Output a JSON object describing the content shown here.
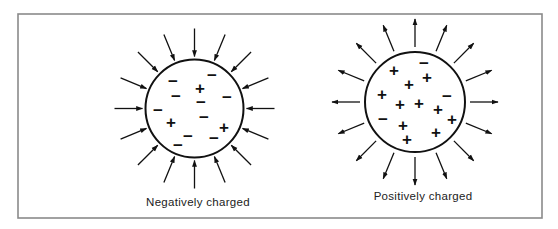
{
  "figure": {
    "frame": {
      "x": 18,
      "y": 14,
      "width": 524,
      "height": 204,
      "stroke": "#8a8a8a"
    },
    "ink_color": "#111111",
    "particles": [
      {
        "id": "negative",
        "label": "Negatively charged",
        "center": [
          194.5,
          108.5
        ],
        "radius": 49,
        "arrow_direction": "inward",
        "arrow_count": 16,
        "arrow_inner_radius": 52,
        "arrow_outer_radius": 80,
        "label_pos": [
          198,
          206
        ],
        "signs": [
          {
            "s": "−",
            "x": 173,
            "y": 81
          },
          {
            "s": "−",
            "x": 212,
            "y": 75
          },
          {
            "s": "+",
            "x": 200,
            "y": 88
          },
          {
            "s": "−",
            "x": 176,
            "y": 96
          },
          {
            "s": "−",
            "x": 227,
            "y": 97
          },
          {
            "s": "−",
            "x": 201,
            "y": 102
          },
          {
            "s": "−",
            "x": 158,
            "y": 110
          },
          {
            "s": "−",
            "x": 204,
            "y": 117
          },
          {
            "s": "+",
            "x": 171,
            "y": 122
          },
          {
            "s": "+",
            "x": 224,
            "y": 127
          },
          {
            "s": "−",
            "x": 188,
            "y": 136
          },
          {
            "s": "−",
            "x": 214,
            "y": 138
          },
          {
            "s": "−",
            "x": 178,
            "y": 145
          }
        ]
      },
      {
        "id": "positive",
        "label": "Positively charged",
        "center": [
          415,
          102
        ],
        "radius": 50,
        "arrow_direction": "outward",
        "arrow_count": 16,
        "arrow_inner_radius": 55,
        "arrow_outer_radius": 83,
        "label_pos": [
          423,
          200
        ],
        "signs": [
          {
            "s": "−",
            "x": 424,
            "y": 63
          },
          {
            "s": "+",
            "x": 394,
            "y": 70
          },
          {
            "s": "+",
            "x": 427,
            "y": 77
          },
          {
            "s": "+",
            "x": 409,
            "y": 84
          },
          {
            "s": "+",
            "x": 382,
            "y": 94
          },
          {
            "s": "−",
            "x": 447,
            "y": 96
          },
          {
            "s": "+",
            "x": 419,
            "y": 103
          },
          {
            "s": "+",
            "x": 400,
            "y": 104
          },
          {
            "s": "+",
            "x": 438,
            "y": 109
          },
          {
            "s": "−",
            "x": 383,
            "y": 119
          },
          {
            "s": "+",
            "x": 452,
            "y": 119
          },
          {
            "s": "+",
            "x": 403,
            "y": 125
          },
          {
            "s": "+",
            "x": 436,
            "y": 132
          },
          {
            "s": "+",
            "x": 407,
            "y": 139
          }
        ]
      }
    ]
  }
}
